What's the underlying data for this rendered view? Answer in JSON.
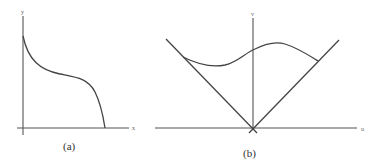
{
  "panels": [
    {
      "id": "a",
      "caption": "(a)",
      "x_axis_label": "x",
      "y_axis_label": "y",
      "description": "Decreasing curve starting on y-axis, flattening near middle, then dropping steeply to x-axis"
    },
    {
      "id": "b",
      "caption": "(b)",
      "x_axis_label": "u",
      "y_axis_label": "v",
      "description": "Two lines crossing at origin forming a V (light cone); wavy curve connecting the two lines above the origin"
    }
  ],
  "colors": {
    "background": "#ffffff",
    "line": "#444444",
    "axis": "#555555"
  }
}
